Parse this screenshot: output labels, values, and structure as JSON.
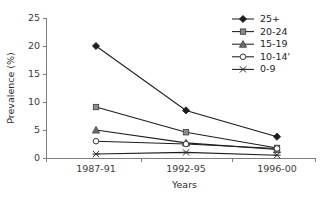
{
  "chart_data": {
    "type": "line",
    "title": "",
    "xlabel": "Years",
    "ylabel": "Prevalence (%)",
    "categories": [
      "1987-91",
      "1992-95",
      "1996-00"
    ],
    "yticks": [
      0,
      5,
      10,
      15,
      20,
      25
    ],
    "ylim": [
      0,
      25
    ],
    "grid": false,
    "legend_position": "top-right",
    "series": [
      {
        "name": "25+",
        "values": [
          20.0,
          8.5,
          3.8
        ],
        "marker": "diamond",
        "marker_fill": "#1d1d1d",
        "line_color": "#1d1d1d"
      },
      {
        "name": "20-24",
        "values": [
          9.1,
          4.6,
          1.8
        ],
        "marker": "square",
        "marker_fill": "#8a8a8a",
        "line_color": "#1d1d1d"
      },
      {
        "name": "15-19",
        "values": [
          5.0,
          2.7,
          1.5
        ],
        "marker": "triangle",
        "marker_fill": "#6e6e6e",
        "line_color": "#1d1d1d"
      },
      {
        "name": "10-14'",
        "values": [
          3.0,
          2.5,
          1.7
        ],
        "marker": "circle",
        "marker_fill": "#ffffff",
        "line_color": "#1d1d1d"
      },
      {
        "name": "0-9",
        "values": [
          0.7,
          1.0,
          0.5
        ],
        "marker": "cross",
        "marker_fill": "#1d1d1d",
        "line_color": "#1d1d1d"
      }
    ]
  },
  "axes": {
    "y_tick_labels": [
      "0",
      "5",
      "10",
      "15",
      "20",
      "25"
    ],
    "x_tick_labels": [
      "1987-91",
      "1992-95",
      "1996-00"
    ],
    "y_axis_title": "Prevalence (%)",
    "x_axis_title": "Years"
  },
  "legend": {
    "entries": [
      "25+",
      "20-24",
      "15-19",
      "10-14'",
      "0-9"
    ]
  },
  "colors": {
    "axis": "#7d7d7d",
    "line": "#1d1d1d",
    "text": "#2b2b2b",
    "background": "#ffffff"
  }
}
